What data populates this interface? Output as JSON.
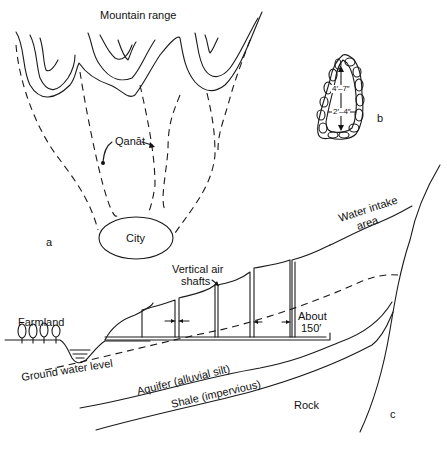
{
  "figure": {
    "panel_a": {
      "marker": "a",
      "labels": {
        "mountain_range": "Mountain range",
        "qanat": "Qanāt",
        "city": "City"
      }
    },
    "panel_b": {
      "marker": "b",
      "dimensions": {
        "height": "4′–7″",
        "width": "2′–4″"
      }
    },
    "panel_c": {
      "marker": "c",
      "labels": {
        "farmland": "Farmland",
        "ground_water_level": "Ground water level",
        "vertical_air_shafts_line1": "Vertical air",
        "vertical_air_shafts_line2": "shafts",
        "about_line1": "About",
        "about_line2": "150′",
        "water_intake_line1": "Water intake",
        "water_intake_line2": "area",
        "aquifer": "Aquifer (alluvial silt)",
        "shale": "Shale (impervious)",
        "rock": "Rock"
      }
    }
  }
}
